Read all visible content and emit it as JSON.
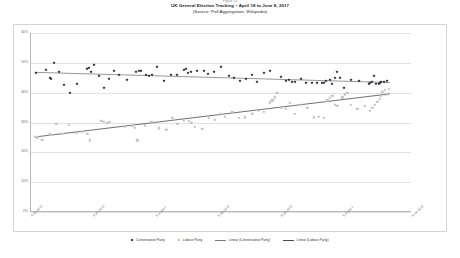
{
  "figure": {
    "number": "Figure 10",
    "title": "UK General Election Tracking – April 18 to June 8, 2017",
    "subtitle": "(Source: Poll Aggregation, Wikipedia)"
  },
  "legend": {
    "items": [
      {
        "label": "Conservative Party",
        "marker": "diamond-marker",
        "color": "#2a2a3a"
      },
      {
        "label": "Labour Party",
        "marker": "square-marker",
        "color": "#c9c9c9"
      },
      {
        "label": "Linear (Conservative Party)",
        "marker": "line-marker",
        "color": "#7d7d7d"
      },
      {
        "label": "Linear (Labour Party)",
        "marker": "line-marker",
        "color": "#4a4a4a"
      }
    ]
  },
  "chart_data": {
    "type": "scatter",
    "title": "UK General Election Tracking – April 18 to June 8, 2017",
    "subtitle": "(Source: Poll Aggregation, Wikipedia)",
    "xlabel": "",
    "ylabel": "",
    "grid": true,
    "legend_position": "bottom",
    "ylim": [
      0,
      60
    ],
    "yticks": [
      0,
      10,
      20,
      30,
      40,
      50,
      60
    ],
    "ytick_labels": [
      "0%",
      "10%",
      "20%",
      "30%",
      "40%",
      "50%",
      "60%"
    ],
    "xlim": [
      0,
      61
    ],
    "xticks": [
      0,
      10,
      20,
      30,
      40,
      50,
      61
    ],
    "xtick_labels": [
      "4-13-2017",
      "4-20-2017",
      "5-2-2017",
      "5-18-2017",
      "5-25-2017",
      "6-4-2017",
      "6-14-2017"
    ],
    "series": [
      {
        "name": "Conservative Party",
        "marker": "diamond",
        "color": "#2a2a3a",
        "points": [
          [
            1.0,
            46.5
          ],
          [
            2.5,
            47.5
          ],
          [
            3.2,
            45.0
          ],
          [
            3.4,
            44.5
          ],
          [
            3.9,
            50.0
          ],
          [
            4.6,
            47.0
          ],
          [
            5.5,
            42.5
          ],
          [
            6.4,
            40.0
          ],
          [
            7.6,
            43.0
          ],
          [
            9.2,
            48.0
          ],
          [
            9.4,
            48.3
          ],
          [
            9.8,
            46.8
          ],
          [
            10.2,
            49.2
          ],
          [
            11.0,
            45.5
          ],
          [
            11.8,
            41.5
          ],
          [
            12.6,
            44.5
          ],
          [
            13.4,
            47.3
          ],
          [
            14.2,
            46.0
          ],
          [
            15.6,
            44.2
          ],
          [
            17.0,
            47.0
          ],
          [
            17.4,
            47.2
          ],
          [
            17.8,
            47.4
          ],
          [
            18.5,
            45.8
          ],
          [
            19.0,
            45.7
          ],
          [
            19.5,
            46.0
          ],
          [
            20.4,
            48.6
          ],
          [
            21.4,
            44.0
          ],
          [
            22.6,
            46.0
          ],
          [
            23.5,
            45.8
          ],
          [
            24.6,
            47.5
          ],
          [
            24.9,
            47.9
          ],
          [
            25.3,
            46.5
          ],
          [
            25.8,
            47.0
          ],
          [
            26.8,
            47.3
          ],
          [
            27.8,
            47.2
          ],
          [
            28.5,
            46.2
          ],
          [
            29.4,
            46.8
          ],
          [
            30.6,
            48.5
          ],
          [
            31.8,
            45.6
          ],
          [
            32.6,
            45.0
          ],
          [
            33.6,
            44.0
          ],
          [
            34.6,
            44.6
          ],
          [
            35.5,
            46.0
          ],
          [
            36.4,
            43.5
          ],
          [
            37.5,
            46.5
          ],
          [
            38.4,
            47.2
          ],
          [
            40.2,
            45.2
          ],
          [
            41.0,
            44.0
          ],
          [
            41.4,
            44.3
          ],
          [
            42.0,
            43.6
          ],
          [
            42.4,
            43.5
          ],
          [
            43.4,
            44.6
          ],
          [
            44.2,
            43.2
          ],
          [
            45.2,
            43.3
          ],
          [
            46.0,
            43.4
          ],
          [
            46.8,
            43.1
          ],
          [
            47.0,
            43.4
          ],
          [
            47.4,
            44.0
          ],
          [
            48.0,
            44.4
          ],
          [
            48.4,
            43.0
          ],
          [
            48.8,
            45.0
          ],
          [
            49.2,
            47.0
          ],
          [
            49.6,
            44.8
          ],
          [
            50.2,
            41.5
          ],
          [
            51.4,
            44.2
          ],
          [
            52.6,
            44.0
          ],
          [
            54.2,
            43.0
          ],
          [
            54.4,
            43.3
          ],
          [
            54.8,
            43.6
          ],
          [
            55.0,
            45.5
          ],
          [
            55.4,
            42.8
          ],
          [
            55.8,
            43.0
          ],
          [
            56.0,
            43.4
          ],
          [
            56.2,
            43.7
          ],
          [
            56.6,
            43.5
          ],
          [
            57.2,
            43.8
          ]
        ]
      },
      {
        "name": "Labour Party",
        "marker": "square",
        "color": "#c3c3c3",
        "points": [
          [
            0.8,
            25.2
          ],
          [
            1.2,
            25.0
          ],
          [
            2.0,
            24.2
          ],
          [
            3.2,
            26.0
          ],
          [
            3.6,
            25.8
          ],
          [
            4.2,
            29.5
          ],
          [
            5.2,
            26.2
          ],
          [
            6.2,
            29.2
          ],
          [
            7.4,
            26.5
          ],
          [
            8.4,
            26.8
          ],
          [
            9.2,
            26.2
          ],
          [
            9.6,
            24.0
          ],
          [
            11.4,
            30.5
          ],
          [
            11.8,
            30.2
          ],
          [
            12.4,
            30.0
          ],
          [
            12.8,
            30.2
          ],
          [
            15.2,
            28.5
          ],
          [
            16.4,
            28.8
          ],
          [
            16.8,
            28.2
          ],
          [
            17.2,
            24.0
          ],
          [
            18.4,
            29.0
          ],
          [
            19.4,
            30.2
          ],
          [
            20.6,
            28.0
          ],
          [
            21.8,
            27.5
          ],
          [
            22.8,
            31.5
          ],
          [
            23.6,
            29.5
          ],
          [
            24.6,
            30.5
          ],
          [
            25.4,
            30.5
          ],
          [
            25.8,
            30.0
          ],
          [
            26.4,
            28.5
          ],
          [
            27.6,
            27.8
          ],
          [
            28.6,
            31.5
          ],
          [
            29.6,
            31.0
          ],
          [
            30.4,
            32.8
          ],
          [
            31.2,
            32.0
          ],
          [
            32.4,
            33.5
          ],
          [
            33.4,
            31.5
          ],
          [
            34.4,
            31.8
          ],
          [
            35.6,
            33.0
          ],
          [
            36.6,
            34.0
          ],
          [
            37.4,
            33.5
          ],
          [
            38.4,
            36.8
          ],
          [
            38.8,
            37.5
          ],
          [
            39.2,
            38.5
          ],
          [
            39.6,
            40.0
          ],
          [
            40.2,
            35.0
          ],
          [
            41.0,
            34.5
          ],
          [
            41.6,
            36.5
          ],
          [
            42.4,
            33.0
          ],
          [
            43.4,
            36.0
          ],
          [
            44.4,
            35.0
          ],
          [
            45.4,
            31.8
          ],
          [
            46.2,
            32.0
          ],
          [
            47.0,
            31.5
          ],
          [
            47.6,
            37.5
          ],
          [
            48.0,
            38.2
          ],
          [
            48.4,
            39.0
          ],
          [
            48.8,
            36.0
          ],
          [
            49.2,
            35.5
          ],
          [
            50.0,
            38.5
          ],
          [
            50.4,
            39.5
          ],
          [
            50.8,
            40.0
          ],
          [
            51.4,
            36.0
          ],
          [
            52.4,
            34.5
          ],
          [
            53.6,
            35.5
          ],
          [
            54.4,
            34.0
          ],
          [
            54.8,
            35.0
          ],
          [
            55.2,
            36.0
          ],
          [
            55.6,
            37.0
          ],
          [
            56.0,
            38.0
          ],
          [
            56.2,
            39.0
          ],
          [
            56.4,
            40.2
          ],
          [
            56.8,
            41.0
          ],
          [
            57.0,
            39.5
          ],
          [
            57.4,
            41.2
          ]
        ]
      }
    ],
    "trendlines": [
      {
        "name": "Linear (Conservative Party)",
        "color": "#7d7d7d",
        "x0": 1.0,
        "y0": 46.8,
        "x1": 57.6,
        "y1": 43.4
      },
      {
        "name": "Linear (Labour Party)",
        "color": "#4a4a4a",
        "x0": 1.0,
        "y0": 25.2,
        "x1": 57.6,
        "y1": 39.6
      }
    ]
  }
}
